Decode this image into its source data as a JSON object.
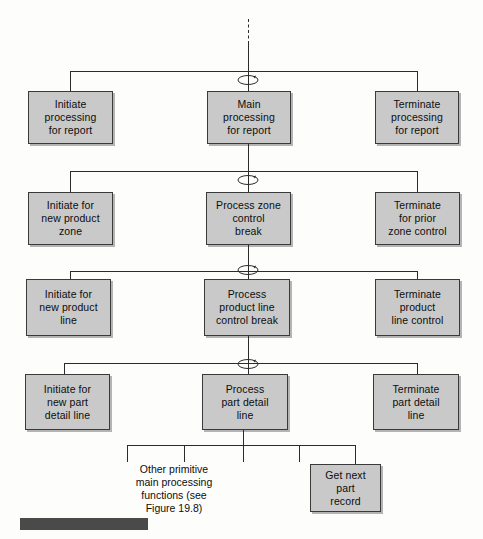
{
  "figure": {
    "type": "structure-chart",
    "background_color": "#fdfdfc",
    "box_fill_color": "#c9c9c9",
    "box_border_color": "#3a3a3a",
    "line_color": "#2b2b2b",
    "caption_bar_color": "#4a4a4a"
  },
  "levels": [
    {
      "name": "level-1-report",
      "parent_label": "Main\nprocessing\nfor report",
      "modules": [
        {
          "id": "initiate-processing-for-report",
          "label": "Initiate\nprocessing\nfor report",
          "role": "initiate"
        },
        {
          "id": "main-processing-for-report",
          "label": "Main\nprocessing\nfor report",
          "role": "process"
        },
        {
          "id": "terminate-processing-for-report",
          "label": "Terminate\nprocessing\nfor report",
          "role": "terminate"
        }
      ]
    },
    {
      "name": "level-2-zone",
      "parent_label": "Process zone\ncontrol\nbreak",
      "modules": [
        {
          "id": "initiate-for-new-product-zone",
          "label": "Initiate for\nnew product\nzone",
          "role": "initiate"
        },
        {
          "id": "process-zone-control-break",
          "label": "Process zone\ncontrol\nbreak",
          "role": "process"
        },
        {
          "id": "terminate-for-prior-zone-control",
          "label": "Terminate\nfor prior\nzone control",
          "role": "terminate"
        }
      ]
    },
    {
      "name": "level-3-product-line",
      "parent_label": "Process\nproduct line\ncontrol break",
      "modules": [
        {
          "id": "initiate-for-new-product-line",
          "label": "Initiate for\nnew product\nline",
          "role": "initiate"
        },
        {
          "id": "process-product-line-control-break",
          "label": "Process\nproduct line\ncontrol break",
          "role": "process"
        },
        {
          "id": "terminate-product-line-control",
          "label": "Terminate\nproduct\nline control",
          "role": "terminate"
        }
      ]
    },
    {
      "name": "level-4-part-detail",
      "parent_label": "Process\npart detail\nline",
      "modules": [
        {
          "id": "initiate-for-new-part-detail-line",
          "label": "Initiate for\nnew part\ndetail line",
          "role": "initiate"
        },
        {
          "id": "process-part-detail-line",
          "label": "Process\npart detail\nline",
          "role": "process"
        },
        {
          "id": "terminate-part-detail-line",
          "label": "Terminate\npart detail\nline",
          "role": "terminate"
        }
      ]
    }
  ],
  "leaf_level": {
    "name": "level-5-primitives",
    "parent_label": "Process\npart detail\nline",
    "stub_count": 5,
    "annotation": "Other primitive\nmain processing\nfunctions (see\nFigure 19.8)",
    "modules": [
      {
        "id": "get-next-part-record",
        "label": "Get next\npart\nrecord",
        "role": "process"
      }
    ]
  },
  "symbols": {
    "loop_count": 4,
    "loop_name": "iteration-loop-symbol",
    "top_connector": "dashed-continuation-line"
  }
}
